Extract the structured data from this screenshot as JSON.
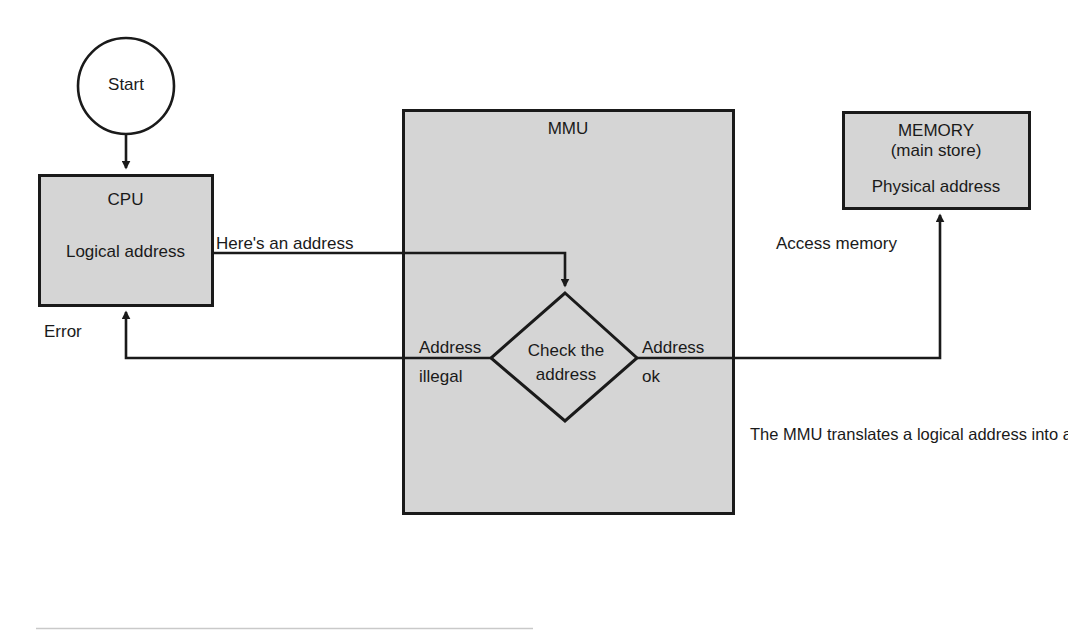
{
  "diagram": {
    "colors": {
      "box_fill": "#d5d5d5",
      "stroke": "#1a1a1a",
      "page_background": "#ffffff",
      "rule": "#c9c9c9"
    },
    "nodes": {
      "start": {
        "label": "Start",
        "shape": "circle"
      },
      "cpu": {
        "title": "CPU",
        "subtitle": "Logical address",
        "shape": "rectangle"
      },
      "mmu": {
        "title": "MMU",
        "shape": "rectangle"
      },
      "memory": {
        "title": "MEMORY",
        "subtitle1": "(main store)",
        "subtitle2": "Physical address",
        "shape": "rectangle"
      },
      "decision": {
        "line1": "Check the",
        "line2": "address",
        "shape": "diamond"
      }
    },
    "edges": {
      "start_to_cpu": {
        "label": ""
      },
      "cpu_to_mmu": {
        "label": "Here's an address"
      },
      "mmu_to_cpu": {
        "label": "Error"
      },
      "mmu_to_memory": {
        "label": "Access memory"
      },
      "decision_illegal": {
        "line1": "Address",
        "line2": "illegal"
      },
      "decision_ok": {
        "line1": "Address",
        "line2": "ok"
      }
    },
    "note": "The MMU translates a logical address into a physical address. If a translation is not possible, the MMU informs the CPU that the current access can't be completed."
  }
}
